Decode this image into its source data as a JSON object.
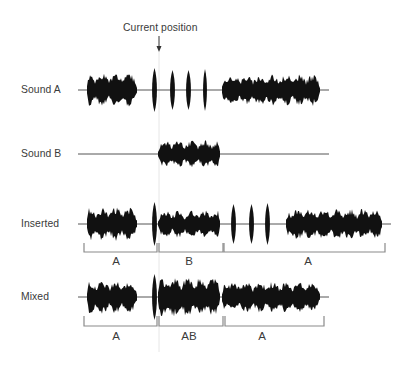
{
  "diagram": {
    "marker": {
      "label": "Current position",
      "x": 159,
      "label_y": 28
    },
    "tracks": [
      {
        "name": "Sound A",
        "baseline_y": 90,
        "line_x": [
          78,
          329
        ],
        "segments": [
          {
            "type": "dense",
            "x": [
              87,
              137
            ],
            "amp": 17,
            "seed": 1
          },
          {
            "type": "pulse",
            "x": [
              152,
              157
            ],
            "amp": 22
          },
          {
            "type": "pulse",
            "x": [
              170,
              175
            ],
            "amp": 20
          },
          {
            "type": "pulse",
            "x": [
              186,
              191
            ],
            "amp": 20
          },
          {
            "type": "pulse",
            "x": [
              203,
              207
            ],
            "amp": 21
          },
          {
            "type": "dense",
            "x": [
              222,
              320
            ],
            "amp": 16,
            "seed": 2
          }
        ]
      },
      {
        "name": "Sound B",
        "baseline_y": 154,
        "line_x": [
          78,
          329
        ],
        "segments": [
          {
            "type": "dense",
            "x": [
              158,
              220
            ],
            "amp": 14,
            "seed": 3
          }
        ]
      },
      {
        "name": "Inserted",
        "baseline_y": 224,
        "line_x": [
          78,
          391
        ],
        "segments": [
          {
            "type": "dense",
            "x": [
              87,
              137
            ],
            "amp": 17,
            "seed": 1
          },
          {
            "type": "pulse",
            "x": [
              152,
              157
            ],
            "amp": 22
          },
          {
            "type": "dense",
            "x": [
              158,
              220
            ],
            "amp": 14,
            "seed": 3
          },
          {
            "type": "pulse",
            "x": [
              231,
              236
            ],
            "amp": 20
          },
          {
            "type": "pulse",
            "x": [
              249,
              254
            ],
            "amp": 20
          },
          {
            "type": "pulse",
            "x": [
              265,
              270
            ],
            "amp": 21
          },
          {
            "type": "dense",
            "x": [
              286,
              382
            ],
            "amp": 16,
            "seed": 2
          }
        ],
        "brackets": [
          {
            "label": "A",
            "x": [
              84,
              157
            ]
          },
          {
            "label": "B",
            "x": [
              159,
              223
            ]
          },
          {
            "label": "A",
            "x": [
              224,
              385
            ]
          }
        ],
        "bracket_y": [
          243,
          252
        ],
        "label_y": 263
      },
      {
        "name": "Mixed",
        "baseline_y": 297,
        "line_x": [
          78,
          329
        ],
        "segments": [
          {
            "type": "dense",
            "x": [
              87,
              137
            ],
            "amp": 17,
            "seed": 1
          },
          {
            "type": "pulse",
            "x": [
              152,
              157
            ],
            "amp": 23
          },
          {
            "type": "dense",
            "x": [
              158,
              220
            ],
            "amp": 20,
            "seed": 4
          },
          {
            "type": "dense",
            "x": [
              222,
              320
            ],
            "amp": 16,
            "seed": 2
          }
        ],
        "brackets": [
          {
            "label": "A",
            "x": [
              84,
              157
            ]
          },
          {
            "label": "AB",
            "x": [
              159,
              223
            ]
          },
          {
            "label": "A",
            "x": [
              225,
              324
            ]
          }
        ],
        "bracket_y": [
          316,
          326
        ],
        "label_y": 338
      }
    ],
    "colors": {
      "wave": "#111111",
      "line": "#555555",
      "bracket": "#8a8a8a",
      "marker_line": "#e6e6e6"
    }
  }
}
